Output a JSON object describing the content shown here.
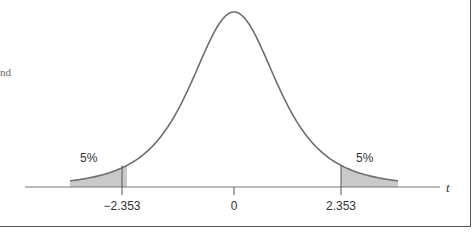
{
  "chart_data": {
    "type": "area",
    "title": "",
    "xlabel": "t",
    "ylabel": "",
    "x_ticks": [
      {
        "value": -2.353,
        "label": "−2.353"
      },
      {
        "value": 0,
        "label": "0"
      },
      {
        "value": 2.353,
        "label": "2.353"
      }
    ],
    "shaded_regions": [
      {
        "name": "left tail",
        "from": "-inf",
        "to": -2.353,
        "area_label": "5%"
      },
      {
        "name": "right tail",
        "from": 2.353,
        "to": "inf",
        "area_label": "5%"
      }
    ],
    "degrees_of_freedom_implied": 3,
    "grid": false
  },
  "labels": {
    "left_tail": "5%",
    "right_tail": "5%",
    "tick_left": "−2.353",
    "tick_center": "0",
    "tick_right": "2.353",
    "axis_var": "t",
    "cut_text": "nd"
  },
  "colors": {
    "curve": "#6e6e6e",
    "shade": "#c9c9c9",
    "axis": "#777777"
  }
}
